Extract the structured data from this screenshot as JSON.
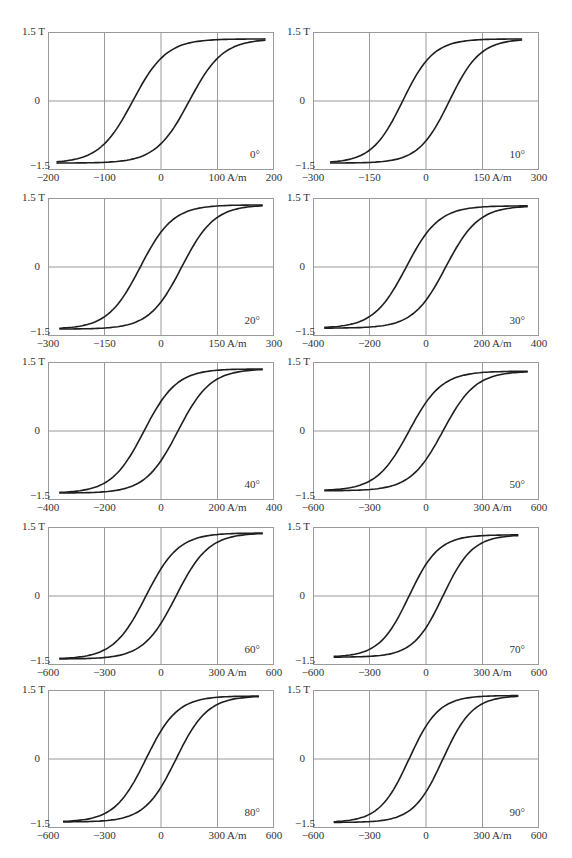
{
  "figure": {
    "y_axis": {
      "top_label": "1.5 T",
      "mid_label": "0",
      "bottom_label": "−1.5"
    },
    "panels": [
      {
        "angle": "0°",
        "xticks": [
          "−200",
          "−100",
          "0",
          "100 A/m",
          "200"
        ],
        "xmax": 200
      },
      {
        "angle": "10°",
        "xticks": [
          "−300",
          "−150",
          "0",
          "150 A/m",
          "300"
        ],
        "xmax": 300
      },
      {
        "angle": "20°",
        "xticks": [
          "−300",
          "−150",
          "0",
          "150 A/m",
          "300"
        ],
        "xmax": 300
      },
      {
        "angle": "30°",
        "xticks": [
          "−400",
          "−200",
          "0",
          "200 A/m",
          "400"
        ],
        "xmax": 400
      },
      {
        "angle": "40°",
        "xticks": [
          "−400",
          "−200",
          "0",
          "200 A/m",
          "400"
        ],
        "xmax": 400
      },
      {
        "angle": "50°",
        "xticks": [
          "−600",
          "−300",
          "0",
          "300 A/m",
          "600"
        ],
        "xmax": 600
      },
      {
        "angle": "60°",
        "xticks": [
          "−600",
          "−300",
          "0",
          "300 A/m",
          "600"
        ],
        "xmax": 600
      },
      {
        "angle": "70°",
        "xticks": [
          "−600",
          "−300",
          "0",
          "300 A/m",
          "600"
        ],
        "xmax": 600
      },
      {
        "angle": "80°",
        "xticks": [
          "−600",
          "−300",
          "0",
          "300 A/m",
          "600"
        ],
        "xmax": 600
      },
      {
        "angle": "90°",
        "xticks": [
          "−600",
          "−300",
          "0",
          "300 A/m",
          "600"
        ],
        "xmax": 600
      }
    ]
  },
  "chart_data": [
    {
      "type": "line",
      "title": "0°",
      "xlabel": "A/m",
      "ylabel": "T",
      "xlim": [
        -200,
        200
      ],
      "ylim": [
        -1.5,
        1.5
      ],
      "grid": true,
      "series": [
        {
          "name": "descending",
          "x": [
            185,
            100,
            50,
            0,
            -30,
            -45,
            -60,
            -90,
            -150,
            -190
          ],
          "y": [
            1.35,
            1.28,
            1.15,
            0.95,
            0.6,
            0,
            -0.7,
            -1.1,
            -1.3,
            -1.35
          ]
        },
        {
          "name": "ascending",
          "x": [
            -190,
            -100,
            0,
            30,
            55,
            70,
            90,
            150,
            185
          ],
          "y": [
            -1.35,
            -1.3,
            -1.05,
            -0.7,
            0,
            0.7,
            1.0,
            1.28,
            1.35
          ]
        }
      ],
      "coercivity": 50,
      "saturation": 1.35
    },
    {
      "type": "line",
      "title": "10°",
      "xlabel": "A/m",
      "ylabel": "T",
      "xlim": [
        -300,
        300
      ],
      "ylim": [
        -1.5,
        1.5
      ],
      "grid": true,
      "series": [
        {
          "name": "descending",
          "x": [
            255,
            150,
            50,
            0,
            -40,
            -60,
            -90,
            -150,
            -255
          ],
          "y": [
            1.35,
            1.28,
            1.15,
            0.9,
            0.5,
            0,
            -0.8,
            -1.2,
            -1.35
          ]
        },
        {
          "name": "ascending",
          "x": [
            -255,
            -150,
            0,
            40,
            65,
            90,
            150,
            255
          ],
          "y": [
            -1.35,
            -1.3,
            -1.0,
            -0.5,
            0,
            0.8,
            1.2,
            1.35
          ]
        }
      ],
      "coercivity": 62,
      "saturation": 1.35
    },
    {
      "type": "line",
      "title": "20°",
      "xlabel": "A/m",
      "ylabel": "T",
      "xlim": [
        -300,
        300
      ],
      "ylim": [
        -1.5,
        1.5
      ],
      "grid": true,
      "series": [
        {
          "name": "descending",
          "x": [
            270,
            150,
            50,
            0,
            -40,
            -55,
            -90,
            -150,
            -270
          ],
          "y": [
            1.3,
            1.25,
            1.1,
            0.85,
            0.5,
            0,
            -0.8,
            -1.1,
            -1.35
          ]
        },
        {
          "name": "ascending",
          "x": [
            -270,
            -150,
            0,
            40,
            55,
            90,
            150,
            270
          ],
          "y": [
            -1.35,
            -1.3,
            -0.95,
            -0.5,
            0,
            0.8,
            1.15,
            1.3
          ]
        }
      ],
      "coercivity": 55,
      "saturation": 1.35
    },
    {
      "type": "line",
      "title": "30°",
      "xlabel": "A/m",
      "ylabel": "T",
      "xlim": [
        -400,
        400
      ],
      "ylim": [
        -1.5,
        1.5
      ],
      "grid": true,
      "series": [
        {
          "name": "descending",
          "x": [
            360,
            200,
            50,
            0,
            -50,
            -70,
            -130,
            -200,
            -360
          ],
          "y": [
            1.32,
            1.28,
            1.1,
            0.85,
            0.45,
            0,
            -0.85,
            -1.1,
            -1.35
          ]
        },
        {
          "name": "ascending",
          "x": [
            -360,
            -200,
            0,
            50,
            70,
            130,
            200,
            360
          ],
          "y": [
            -1.35,
            -1.3,
            -0.95,
            -0.45,
            0,
            0.85,
            1.15,
            1.32
          ]
        }
      ],
      "coercivity": 70,
      "saturation": 1.33
    },
    {
      "type": "line",
      "title": "40°",
      "xlabel": "A/m",
      "ylabel": "T",
      "xlim": [
        -400,
        400
      ],
      "ylim": [
        -1.5,
        1.5
      ],
      "grid": true,
      "series": [
        {
          "name": "descending",
          "x": [
            360,
            200,
            50,
            0,
            -40,
            -60,
            -110,
            -200,
            -360
          ],
          "y": [
            1.38,
            1.3,
            1.15,
            0.85,
            0.5,
            0,
            -0.85,
            -1.15,
            -1.3
          ]
        },
        {
          "name": "ascending",
          "x": [
            -360,
            -200,
            0,
            40,
            60,
            110,
            200,
            360
          ],
          "y": [
            -1.3,
            -1.25,
            -0.85,
            -0.5,
            0,
            0.85,
            1.25,
            1.38
          ]
        }
      ],
      "coercivity": 60,
      "saturation": 1.35
    },
    {
      "type": "line",
      "title": "50°",
      "xlabel": "A/m",
      "ylabel": "T",
      "xlim": [
        -600,
        600
      ],
      "ylim": [
        -1.5,
        1.5
      ],
      "grid": true,
      "series": [
        {
          "name": "descending",
          "x": [
            540,
            300,
            100,
            0,
            -50,
            -90,
            -200,
            -300,
            -550
          ],
          "y": [
            1.3,
            1.25,
            1.1,
            0.65,
            0.4,
            0,
            -0.9,
            -1.1,
            -1.3
          ]
        },
        {
          "name": "ascending",
          "x": [
            -550,
            -300,
            -100,
            0,
            50,
            90,
            200,
            300,
            540
          ],
          "y": [
            -1.3,
            -1.25,
            -1.1,
            -0.65,
            -0.4,
            0,
            0.9,
            1.15,
            1.3
          ]
        }
      ],
      "coercivity": 90,
      "saturation": 1.3
    },
    {
      "type": "line",
      "title": "60°",
      "xlabel": "A/m",
      "ylabel": "T",
      "xlim": [
        -600,
        600
      ],
      "ylim": [
        -1.5,
        1.5
      ],
      "grid": true,
      "series": [
        {
          "name": "descending",
          "x": [
            540,
            300,
            100,
            0,
            -50,
            -80,
            -180,
            -300,
            -540
          ],
          "y": [
            1.35,
            1.28,
            1.1,
            0.6,
            0.35,
            0,
            -0.95,
            -1.25,
            -1.38
          ]
        },
        {
          "name": "ascending",
          "x": [
            -540,
            -300,
            -100,
            0,
            50,
            80,
            180,
            300,
            540
          ],
          "y": [
            -1.38,
            -1.3,
            -1.1,
            -0.6,
            -0.35,
            0,
            0.95,
            1.25,
            1.35
          ]
        }
      ],
      "coercivity": 80,
      "saturation": 1.37
    },
    {
      "type": "line",
      "title": "70°",
      "xlabel": "A/m",
      "ylabel": "T",
      "xlim": [
        -600,
        600
      ],
      "ylim": [
        -1.5,
        1.5
      ],
      "grid": true,
      "series": [
        {
          "name": "descending",
          "x": [
            490,
            300,
            100,
            0,
            -50,
            -90,
            -200,
            -300,
            -490
          ],
          "y": [
            1.35,
            1.25,
            1.0,
            0.55,
            0.3,
            0,
            -0.8,
            -1.1,
            -1.3
          ]
        },
        {
          "name": "ascending",
          "x": [
            -490,
            -300,
            -100,
            0,
            50,
            90,
            200,
            300,
            490
          ],
          "y": [
            -1.3,
            -1.25,
            -1.0,
            -0.55,
            -0.3,
            0,
            0.8,
            1.1,
            1.35
          ]
        }
      ],
      "coercivity": 90,
      "saturation": 1.33
    },
    {
      "type": "line",
      "title": "80°",
      "xlabel": "A/m",
      "ylabel": "T",
      "xlim": [
        -600,
        600
      ],
      "ylim": [
        -1.5,
        1.5
      ],
      "grid": true,
      "series": [
        {
          "name": "descending",
          "x": [
            520,
            300,
            100,
            0,
            -50,
            -80,
            -200,
            -300,
            -540
          ],
          "y": [
            1.35,
            1.3,
            1.1,
            0.65,
            0.35,
            0,
            -0.9,
            -1.2,
            -1.38
          ]
        },
        {
          "name": "ascending",
          "x": [
            -540,
            -300,
            -100,
            0,
            50,
            80,
            200,
            300,
            520
          ],
          "y": [
            -1.38,
            -1.3,
            -1.1,
            -0.65,
            -0.35,
            0,
            0.9,
            1.2,
            1.35
          ]
        }
      ],
      "coercivity": 80,
      "saturation": 1.37
    },
    {
      "type": "line",
      "title": "90°",
      "xlabel": "A/m",
      "ylabel": "T",
      "xlim": [
        -600,
        600
      ],
      "ylim": [
        -1.5,
        1.5
      ],
      "grid": true,
      "series": [
        {
          "name": "descending",
          "x": [
            490,
            300,
            100,
            0,
            -50,
            -90,
            -200,
            -300,
            -510
          ],
          "y": [
            1.38,
            1.3,
            1.0,
            0.55,
            0.3,
            0,
            -0.9,
            -1.2,
            -1.38
          ]
        },
        {
          "name": "ascending",
          "x": [
            -510,
            -300,
            -100,
            0,
            50,
            90,
            200,
            300,
            490
          ],
          "y": [
            -1.38,
            -1.32,
            -1.1,
            -0.6,
            -0.3,
            0,
            0.85,
            1.2,
            1.38
          ]
        }
      ],
      "coercivity": 90,
      "saturation": 1.38
    }
  ]
}
